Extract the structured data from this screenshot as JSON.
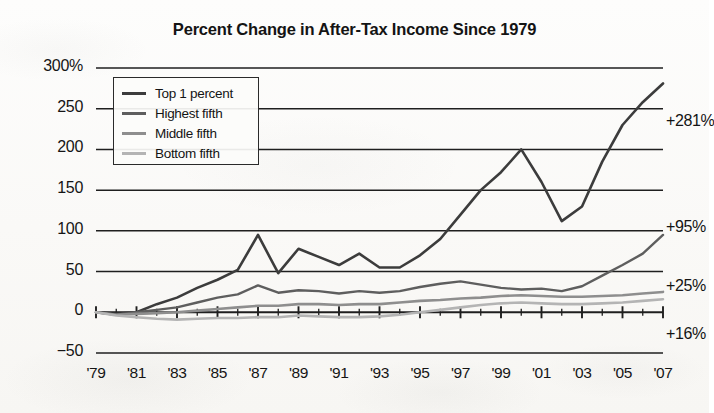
{
  "chart_data": {
    "type": "line",
    "title": "Percent Change in After-Tax Income Since 1979",
    "xlabel": "",
    "ylabel": "",
    "xlim": [
      1979,
      2007
    ],
    "ylim": [
      -50,
      300
    ],
    "y_ticks": [
      "300%",
      "250",
      "200",
      "150",
      "100",
      "50",
      "0",
      "-50"
    ],
    "y_tick_values": [
      300,
      250,
      200,
      150,
      100,
      50,
      0,
      -50
    ],
    "x_ticks": [
      "'79",
      "'81",
      "'83",
      "'85",
      "'87",
      "'89",
      "'91",
      "'93",
      "'95",
      "'97",
      "'99",
      "'01",
      "'03",
      "'05",
      "'07"
    ],
    "x_tick_values": [
      1979,
      1981,
      1983,
      1985,
      1987,
      1989,
      1991,
      1993,
      1995,
      1997,
      1999,
      2001,
      2003,
      2005,
      2007
    ],
    "grid": true,
    "legend_position": "upper-left",
    "x": [
      1979,
      1980,
      1981,
      1982,
      1983,
      1984,
      1985,
      1986,
      1987,
      1988,
      1989,
      1990,
      1991,
      1992,
      1993,
      1994,
      1995,
      1996,
      1997,
      1998,
      1999,
      2000,
      2001,
      2002,
      2003,
      2004,
      2005,
      2006,
      2007
    ],
    "series": [
      {
        "name": "Top 1 percent",
        "color": "#3c3c3c",
        "end_label": "+281%",
        "values": [
          0,
          -2,
          0,
          10,
          18,
          30,
          40,
          52,
          95,
          48,
          78,
          68,
          58,
          72,
          55,
          55,
          70,
          90,
          120,
          150,
          172,
          200,
          160,
          112,
          130,
          185,
          230,
          258,
          281
        ]
      },
      {
        "name": "Highest fifth",
        "color": "#5e5e5e",
        "end_label": "+95%",
        "values": [
          0,
          -3,
          0,
          3,
          6,
          12,
          18,
          22,
          33,
          24,
          27,
          26,
          23,
          26,
          24,
          26,
          31,
          35,
          38,
          34,
          30,
          28,
          29,
          26,
          32,
          45,
          58,
          72,
          95
        ]
      },
      {
        "name": "Middle fifth",
        "color": "#8e8e8e",
        "end_label": "+25%",
        "values": [
          0,
          -3,
          -2,
          -1,
          0,
          2,
          4,
          6,
          8,
          8,
          10,
          10,
          9,
          10,
          10,
          12,
          14,
          15,
          17,
          18,
          20,
          21,
          20,
          19,
          19,
          20,
          21,
          23,
          25
        ]
      },
      {
        "name": "Bottom fifth",
        "color": "#b4b4b4",
        "end_label": "+16%",
        "values": [
          0,
          -4,
          -6,
          -8,
          -9,
          -8,
          -7,
          -7,
          -6,
          -6,
          -4,
          -5,
          -6,
          -6,
          -5,
          -3,
          0,
          3,
          6,
          9,
          11,
          12,
          11,
          10,
          10,
          11,
          12,
          14,
          16
        ]
      }
    ]
  },
  "legend": {
    "items": [
      {
        "label": "Top 1 percent"
      },
      {
        "label": "Highest fifth"
      },
      {
        "label": "Middle fifth"
      },
      {
        "label": "Bottom fifth"
      }
    ]
  }
}
